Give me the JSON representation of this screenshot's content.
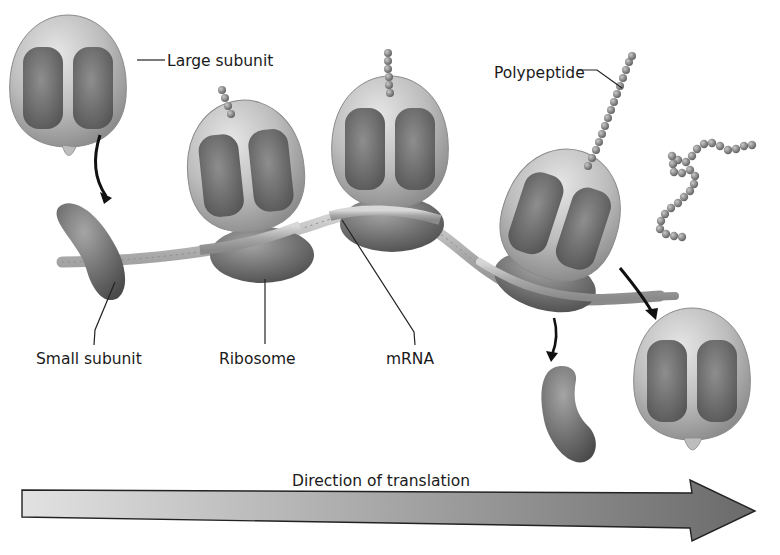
{
  "figure": {
    "type": "diagram",
    "colors": {
      "background": "#ffffff",
      "subunit_light": "#c4c4c4",
      "subunit_dark": "#6a6a6a",
      "mrna": "#b0b0b0",
      "polypeptide_bead": "#7d7d7d",
      "arrow_start": "#e0e0e0",
      "arrow_end": "#6e6e6e",
      "text": "#1a1a1a"
    }
  },
  "labels": {
    "large_subunit": "Large subunit",
    "small_subunit": "Small subunit",
    "ribosome": "Ribosome",
    "mrna": "mRNA",
    "polypeptide": "Polypeptide",
    "direction": "Direction of translation"
  },
  "elements": {
    "ribosomes_on_mrna": 3,
    "free_large_subunits": 2,
    "free_small_subunits": 2,
    "released_polypeptides": 1
  }
}
